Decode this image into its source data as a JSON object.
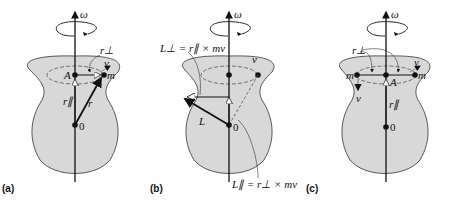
{
  "figure": {
    "panels": [
      {
        "id": "a",
        "label": "(a)",
        "labels": {
          "omega": "ω",
          "r_perp": "r⊥",
          "v": "v",
          "A": "A",
          "m": "m",
          "r_par": "r∥",
          "r": "r",
          "origin": "0"
        }
      },
      {
        "id": "b",
        "label": "(b)",
        "labels": {
          "omega": "ω",
          "v": "v",
          "L": "L",
          "origin": "0",
          "L_perp_eq": "L⊥ = r∥ × mv",
          "L_par_eq": "L∥ = r⊥ × mv"
        }
      },
      {
        "id": "c",
        "label": "(c)",
        "labels": {
          "omega": "ω",
          "r_perp": "r⊥",
          "v_right": "v",
          "v_left": "v",
          "m_left": "m",
          "m_right": "m",
          "A": "A",
          "r_par": "r∥",
          "origin": "0"
        }
      }
    ],
    "colors": {
      "body_fill": "#d8d8d8",
      "outline": "#333333",
      "axis": "#111111"
    }
  }
}
